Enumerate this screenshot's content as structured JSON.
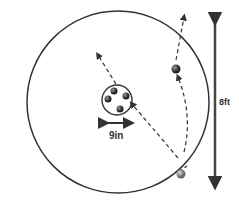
{
  "diagram": {
    "labels": {
      "hole_width": "9in",
      "circle_diameter": "8ft"
    },
    "colors": {
      "stroke": "#333333",
      "ball": "#444444",
      "ball_light": "#888888"
    }
  }
}
